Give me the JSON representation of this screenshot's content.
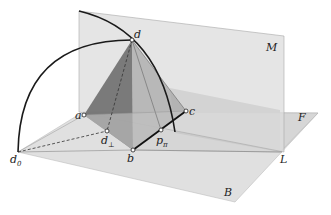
{
  "diagram": {
    "planes": [
      {
        "id": "M",
        "label": "M",
        "role": "vertical plane"
      },
      {
        "id": "F",
        "label": "F",
        "role": "horizontal plane (front)"
      },
      {
        "id": "B",
        "label": "B",
        "role": "base plane"
      }
    ],
    "lines": [
      {
        "id": "L",
        "label": "L",
        "role": "intersection line"
      }
    ],
    "points": [
      {
        "id": "d",
        "label": "d"
      },
      {
        "id": "a",
        "label": "a"
      },
      {
        "id": "b",
        "label": "b"
      },
      {
        "id": "c",
        "label": "c"
      },
      {
        "id": "d_perp",
        "label": "d",
        "subscript": "⊥"
      },
      {
        "id": "d_0",
        "label": "d",
        "subscript": "0"
      },
      {
        "id": "p_pi",
        "label": "p",
        "subscript": "π"
      }
    ],
    "colors": {
      "plane_fill": "#d6d6d6",
      "dark_face": "#6e6e6e",
      "mid_face": "#a8a8a8",
      "arc_stroke": "#1a1a1a"
    }
  }
}
